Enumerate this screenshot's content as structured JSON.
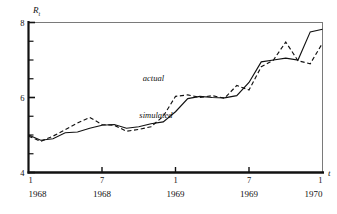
{
  "chart_data": {
    "type": "line",
    "title": "",
    "xlabel": "t",
    "ylabel": "R_t",
    "ylabel_base": "R",
    "ylabel_sub": "t",
    "ylim": [
      4,
      8
    ],
    "ymajor_ticks": [
      4,
      6,
      8
    ],
    "ymajor_tick_labels": [
      "4",
      "6",
      "8"
    ],
    "yminor_ticks": [
      4.5,
      5.0,
      5.5,
      6.5,
      7.0,
      7.5
    ],
    "grid": false,
    "legend_position": "inline-annotations",
    "x_tick_months": [
      "1",
      "7",
      "1",
      "7",
      "1"
    ],
    "x_tick_years": [
      "1968",
      "1968",
      "1969",
      "1969",
      "1970"
    ],
    "x_tick_positions": [
      0,
      6,
      12,
      18,
      24
    ],
    "xlim": [
      0,
      24
    ],
    "x_unit": "months since January 1968",
    "annotations": [
      {
        "text": "actual",
        "x": 10.2,
        "y": 6.45,
        "style": "italic",
        "refers_to": "actual"
      },
      {
        "text": "simulated",
        "x": 10.4,
        "y": 5.45,
        "style": "italic",
        "refers_to": "simulated"
      }
    ],
    "series": [
      {
        "name": "actual",
        "line_style": "dashed",
        "color": "#111111",
        "x": [
          0,
          1,
          2,
          3,
          4,
          5,
          6,
          7,
          8,
          9,
          10,
          11,
          12,
          13,
          14,
          15,
          16,
          17,
          18,
          19,
          20,
          21,
          22,
          23,
          24
        ],
        "values": [
          4.97,
          4.83,
          4.97,
          5.14,
          5.32,
          5.47,
          5.28,
          5.26,
          5.1,
          5.15,
          5.22,
          5.5,
          6.03,
          6.07,
          6.0,
          6.05,
          5.98,
          6.32,
          6.2,
          6.82,
          7.0,
          7.48,
          6.98,
          6.9,
          7.45
        ]
      },
      {
        "name": "simulated",
        "line_style": "solid",
        "color": "#111111",
        "x": [
          0,
          1,
          2,
          3,
          4,
          5,
          6,
          7,
          8,
          9,
          10,
          11,
          12,
          13,
          14,
          15,
          16,
          17,
          18,
          19,
          20,
          21,
          22,
          23,
          24
        ],
        "values": [
          5.0,
          4.86,
          4.9,
          5.06,
          5.08,
          5.18,
          5.26,
          5.28,
          5.18,
          5.22,
          5.3,
          5.35,
          5.62,
          5.97,
          6.03,
          6.0,
          5.99,
          6.05,
          6.4,
          6.95,
          7.0,
          7.05,
          7.0,
          7.75,
          7.82
        ]
      }
    ]
  }
}
